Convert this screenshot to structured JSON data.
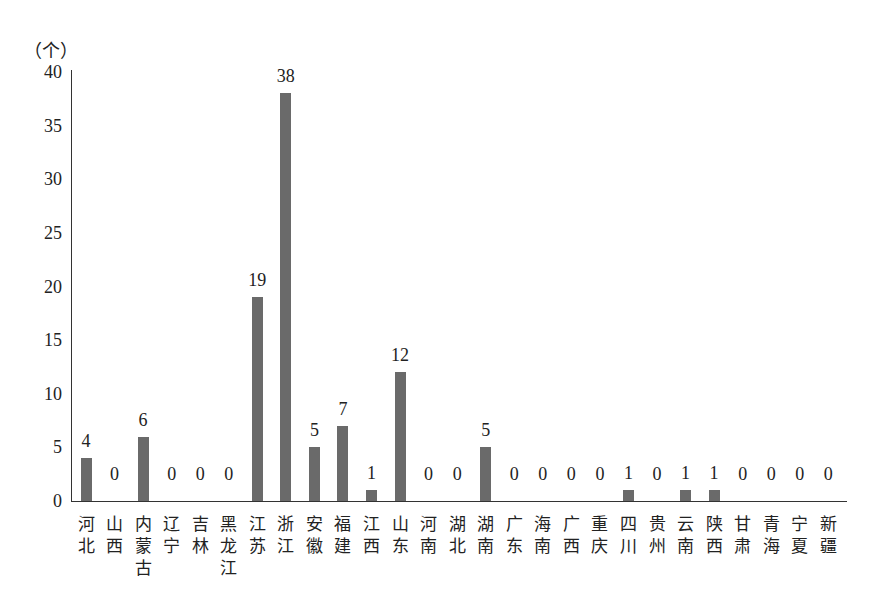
{
  "chart_data": {
    "type": "bar",
    "title": "",
    "xlabel": "",
    "ylabel": "（个）",
    "ylim": [
      0,
      40
    ],
    "yticks": [
      0,
      5,
      10,
      15,
      20,
      25,
      30,
      35,
      40
    ],
    "grid": false,
    "legend": null,
    "categories": [
      "河北",
      "山西",
      "内蒙古",
      "辽宁",
      "吉林",
      "黑龙江",
      "江苏",
      "浙江",
      "安徽",
      "福建",
      "江西",
      "山东",
      "河南",
      "湖北",
      "湖南",
      "广东",
      "海南",
      "广西",
      "重庆",
      "四川",
      "贵州",
      "云南",
      "陕西",
      "甘肃",
      "青海",
      "宁夏",
      "新疆"
    ],
    "values": [
      4,
      0,
      6,
      0,
      0,
      0,
      19,
      38,
      5,
      7,
      1,
      12,
      0,
      0,
      5,
      0,
      0,
      0,
      0,
      1,
      0,
      1,
      1,
      0,
      0,
      0,
      0
    ],
    "data_labels": true,
    "bar_color": "#6a6a6a"
  }
}
